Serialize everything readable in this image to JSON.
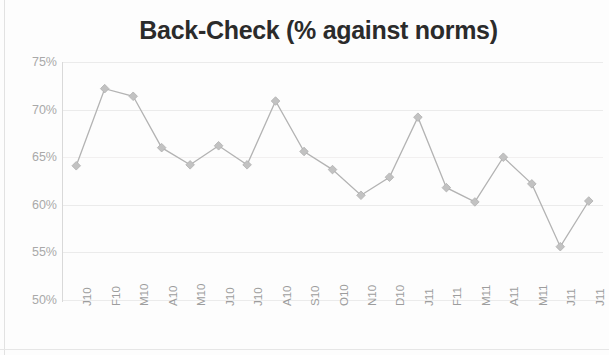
{
  "chart_data": {
    "type": "line",
    "title": "Back-Check (% against norms)",
    "xlabel": "",
    "ylabel": "",
    "ylim": [
      50,
      75
    ],
    "ytick_values": [
      75,
      70,
      65,
      60,
      55,
      50
    ],
    "ytick_labels": [
      "75%",
      "70%",
      "65%",
      "60%",
      "55%",
      "50%"
    ],
    "grid": true,
    "legend": false,
    "legend_position": "none",
    "marker": "diamond",
    "line_color": "#b3b3b3",
    "marker_color": "#c2c2c2",
    "grid_color": "#ebebeb",
    "axis_color": "#d9d9d9",
    "text_color": "#a9a9a9",
    "title_color": "#2b2b2b",
    "categories": [
      "J10",
      "F10",
      "M10",
      "A10",
      "M10",
      "J10",
      "J10",
      "A10",
      "S10",
      "O10",
      "N10",
      "D10",
      "J11",
      "F11",
      "M11",
      "A11",
      "M11",
      "J11",
      "J11"
    ],
    "values": [
      64.1,
      72.2,
      71.4,
      66.0,
      64.2,
      66.2,
      64.2,
      70.9,
      65.6,
      63.7,
      61.0,
      62.9,
      69.2,
      61.8,
      60.3,
      65.0,
      62.2,
      55.6,
      60.4
    ],
    "series": [
      {
        "name": "Back-Check",
        "values": [
          64.1,
          72.2,
          71.4,
          66.0,
          64.2,
          66.2,
          64.2,
          70.9,
          65.6,
          63.7,
          61.0,
          62.9,
          69.2,
          61.8,
          60.3,
          65.0,
          62.2,
          55.6,
          60.4
        ]
      }
    ]
  }
}
